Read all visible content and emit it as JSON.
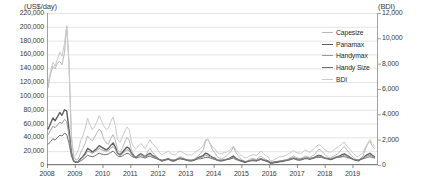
{
  "chart_data": {
    "type": "line",
    "title": "",
    "xlabel": "",
    "ylabel": "(US$/day)",
    "y2label": "(BDI)",
    "grid": true,
    "legend_position": "inside-top-right",
    "ylim": [
      0,
      220000
    ],
    "y2lim": [
      0,
      12000
    ],
    "ytick_labels": [
      "220,000",
      "200,000",
      "180,000",
      "160,000",
      "140,000",
      "120,000",
      "100,000",
      "80,000",
      "60,000",
      "40,000",
      "20,000",
      "0"
    ],
    "ytick_values": [
      220000,
      200000,
      180000,
      160000,
      140000,
      120000,
      100000,
      80000,
      60000,
      40000,
      20000,
      0
    ],
    "y2tick_labels": [
      "12,000",
      "10,000",
      "8,000",
      "6,000",
      "4,000",
      "2,000",
      "0"
    ],
    "y2tick_values": [
      12000,
      10000,
      8000,
      6000,
      4000,
      2000,
      0
    ],
    "xtick_labels": [
      "2008",
      "2009",
      "2010",
      "2011",
      "2012",
      "2013",
      "2014",
      "2015",
      "2016",
      "2017",
      "2018",
      "2019"
    ],
    "xlim": [
      2008.0,
      2019.92
    ],
    "legend": [
      {
        "name": "Capesize",
        "color": "#b9b9b9",
        "width": 1.0,
        "axis": "left"
      },
      {
        "name": "Panamax",
        "color": "#5e5e5e",
        "width": 1.4,
        "axis": "left"
      },
      {
        "name": "Handymax",
        "color": "#9a9a9a",
        "width": 1.0,
        "axis": "left"
      },
      {
        "name": "Handy Size",
        "color": "#6f6f6f",
        "width": 1.0,
        "axis": "left"
      },
      {
        "name": "BDI",
        "color": "#c9c9c9",
        "width": 1.0,
        "axis": "right"
      }
    ],
    "x": [
      2008.04,
      2008.13,
      2008.21,
      2008.29,
      2008.38,
      2008.46,
      2008.54,
      2008.63,
      2008.71,
      2008.79,
      2008.88,
      2008.96,
      2009.04,
      2009.13,
      2009.21,
      2009.29,
      2009.38,
      2009.46,
      2009.54,
      2009.63,
      2009.71,
      2009.79,
      2009.88,
      2009.96,
      2010.04,
      2010.13,
      2010.21,
      2010.29,
      2010.38,
      2010.46,
      2010.54,
      2010.63,
      2010.71,
      2010.79,
      2010.88,
      2010.96,
      2011.04,
      2011.13,
      2011.21,
      2011.29,
      2011.38,
      2011.46,
      2011.54,
      2011.63,
      2011.71,
      2011.79,
      2011.88,
      2011.96,
      2012.04,
      2012.13,
      2012.21,
      2012.29,
      2012.38,
      2012.46,
      2012.54,
      2012.63,
      2012.71,
      2012.79,
      2012.88,
      2012.96,
      2013.04,
      2013.13,
      2013.21,
      2013.29,
      2013.38,
      2013.46,
      2013.54,
      2013.63,
      2013.71,
      2013.79,
      2013.88,
      2013.96,
      2014.04,
      2014.13,
      2014.21,
      2014.29,
      2014.38,
      2014.46,
      2014.54,
      2014.63,
      2014.71,
      2014.79,
      2014.88,
      2014.96,
      2015.04,
      2015.13,
      2015.21,
      2015.29,
      2015.38,
      2015.46,
      2015.54,
      2015.63,
      2015.71,
      2015.79,
      2015.88,
      2015.96,
      2016.04,
      2016.13,
      2016.21,
      2016.29,
      2016.38,
      2016.46,
      2016.54,
      2016.63,
      2016.71,
      2016.79,
      2016.88,
      2016.96,
      2017.04,
      2017.13,
      2017.21,
      2017.29,
      2017.38,
      2017.46,
      2017.54,
      2017.63,
      2017.71,
      2017.79,
      2017.88,
      2017.96,
      2018.04,
      2018.13,
      2018.21,
      2018.29,
      2018.38,
      2018.46,
      2018.54,
      2018.63,
      2018.71,
      2018.79,
      2018.88,
      2018.96,
      2019.04,
      2019.13,
      2019.21,
      2019.29,
      2019.38,
      2019.46,
      2019.54,
      2019.63,
      2019.71,
      2019.79
    ],
    "series": [
      {
        "name": "Capesize",
        "axis": "left",
        "values": [
          112000,
          132000,
          143000,
          139000,
          148000,
          150000,
          145000,
          163000,
          201000,
          150000,
          40000,
          12000,
          7000,
          9000,
          18000,
          24000,
          32000,
          42000,
          38000,
          35000,
          40000,
          46000,
          52000,
          48000,
          38000,
          32000,
          30000,
          38000,
          44000,
          36000,
          22000,
          18000,
          24000,
          32000,
          40000,
          36000,
          22000,
          14000,
          10000,
          13000,
          16000,
          14000,
          12000,
          20000,
          24000,
          19000,
          15000,
          12000,
          8000,
          5000,
          6000,
          7000,
          8000,
          6000,
          5000,
          6000,
          9000,
          12000,
          11000,
          9000,
          8000,
          7000,
          6000,
          8000,
          11000,
          14000,
          17000,
          22000,
          34000,
          38000,
          30000,
          22000,
          18000,
          12000,
          10000,
          9000,
          11000,
          13000,
          16000,
          20000,
          26000,
          19000,
          14000,
          10000,
          7000,
          5000,
          6000,
          8000,
          10000,
          9000,
          8000,
          11000,
          13000,
          10000,
          8000,
          6000,
          3000,
          3000,
          4000,
          5000,
          6000,
          6000,
          7000,
          8000,
          9000,
          11000,
          13000,
          11000,
          10000,
          9000,
          11000,
          13000,
          12000,
          11000,
          13000,
          15000,
          19000,
          23000,
          21000,
          17000,
          14000,
          11000,
          10000,
          12000,
          14000,
          16000,
          19000,
          24000,
          27000,
          22000,
          18000,
          14000,
          11000,
          8000,
          7000,
          9000,
          13000,
          22000,
          30000,
          34000,
          28000,
          24000
        ]
      },
      {
        "name": "Panamax",
        "axis": "left",
        "values": [
          52000,
          60000,
          68000,
          64000,
          70000,
          76000,
          72000,
          80000,
          78000,
          52000,
          18000,
          6000,
          4000,
          5000,
          9000,
          12000,
          17000,
          24000,
          22000,
          19000,
          21000,
          24000,
          28000,
          26000,
          24000,
          22000,
          24000,
          28000,
          32000,
          26000,
          17000,
          15000,
          18000,
          22000,
          26000,
          24000,
          17000,
          13000,
          11000,
          14000,
          16000,
          14000,
          12000,
          15000,
          17000,
          14000,
          12000,
          10000,
          8000,
          6000,
          7000,
          8000,
          9000,
          7000,
          6000,
          7000,
          9000,
          10000,
          9000,
          8000,
          7000,
          6000,
          6000,
          7000,
          9000,
          11000,
          12000,
          14000,
          17000,
          16000,
          13000,
          11000,
          10000,
          7000,
          6000,
          6000,
          7000,
          8000,
          9000,
          11000,
          13000,
          10000,
          8000,
          6000,
          5000,
          4000,
          5000,
          6000,
          7000,
          7000,
          6000,
          8000,
          9000,
          7000,
          6000,
          5000,
          3000,
          3000,
          3500,
          4000,
          5000,
          5000,
          6000,
          7000,
          8000,
          9000,
          10000,
          9000,
          8000,
          8000,
          9000,
          10000,
          10000,
          9000,
          10000,
          11000,
          13000,
          14000,
          13000,
          11000,
          10000,
          9000,
          8000,
          9000,
          11000,
          12000,
          13000,
          15000,
          16000,
          14000,
          12000,
          10000,
          8000,
          7000,
          6000,
          8000,
          10000,
          13000,
          15000,
          17000,
          14000,
          12000
        ]
      },
      {
        "name": "Handymax",
        "axis": "left",
        "values": [
          44000,
          50000,
          56000,
          54000,
          58000,
          62000,
          60000,
          66000,
          63000,
          43000,
          16000,
          6000,
          4000,
          5000,
          8000,
          11000,
          15000,
          20000,
          19000,
          17000,
          19000,
          21000,
          24000,
          22000,
          21000,
          20000,
          21000,
          24000,
          27000,
          23000,
          16000,
          14000,
          16000,
          19000,
          22000,
          21000,
          16000,
          12000,
          11000,
          13000,
          15000,
          13000,
          12000,
          14000,
          16000,
          13000,
          11000,
          10000,
          8000,
          7000,
          7000,
          8000,
          9000,
          8000,
          7000,
          8000,
          9000,
          10000,
          9000,
          8000,
          7000,
          7000,
          7000,
          8000,
          9000,
          10000,
          11000,
          12000,
          14000,
          13000,
          12000,
          10000,
          9000,
          7000,
          7000,
          7000,
          8000,
          8000,
          9000,
          10000,
          11000,
          9000,
          8000,
          7000,
          6000,
          5000,
          5000,
          6000,
          7000,
          7000,
          7000,
          8000,
          9000,
          8000,
          7000,
          6000,
          4000,
          4000,
          4500,
          5000,
          6000,
          6000,
          7000,
          7000,
          8000,
          9000,
          10000,
          9000,
          8000,
          8000,
          9000,
          10000,
          10000,
          9000,
          10000,
          11000,
          12000,
          13000,
          12000,
          11000,
          10000,
          9000,
          9000,
          10000,
          11000,
          12000,
          12000,
          13000,
          14000,
          13000,
          11000,
          10000,
          8000,
          8000,
          7000,
          8000,
          10000,
          12000,
          13000,
          14000,
          13000,
          11000
        ]
      },
      {
        "name": "Handy Size",
        "axis": "left",
        "values": [
          30000,
          34000,
          38000,
          36000,
          40000,
          43000,
          42000,
          46000,
          44000,
          32000,
          13000,
          5000,
          4000,
          4000,
          6000,
          8000,
          11000,
          14000,
          13000,
          12000,
          13000,
          15000,
          17000,
          16000,
          15000,
          15000,
          16000,
          18000,
          20000,
          17000,
          13000,
          12000,
          13000,
          15000,
          17000,
          16000,
          13000,
          11000,
          10000,
          11000,
          12000,
          11000,
          10000,
          12000,
          13000,
          11000,
          10000,
          9000,
          8000,
          7000,
          7000,
          8000,
          8000,
          7000,
          7000,
          7000,
          8000,
          9000,
          8000,
          8000,
          7000,
          7000,
          7000,
          7000,
          8000,
          9000,
          9000,
          10000,
          11000,
          11000,
          10000,
          9000,
          8000,
          7000,
          7000,
          7000,
          7000,
          8000,
          8000,
          9000,
          10000,
          8000,
          7000,
          7000,
          6000,
          5000,
          5000,
          6000,
          6000,
          6000,
          6000,
          7000,
          8000,
          7000,
          6000,
          6000,
          4000,
          4000,
          4500,
          5000,
          5000,
          5500,
          6000,
          6500,
          7000,
          8000,
          9000,
          8000,
          7000,
          7000,
          8000,
          9000,
          9000,
          8000,
          9000,
          10000,
          11000,
          11000,
          11000,
          10000,
          9000,
          9000,
          8000,
          9000,
          10000,
          11000,
          11000,
          12000,
          12000,
          11000,
          10000,
          9000,
          8000,
          7000,
          7000,
          8000,
          9000,
          10000,
          11000,
          12000,
          11000,
          10000
        ]
      },
      {
        "name": "BDI",
        "axis": "right",
        "values": [
          6500,
          7400,
          8100,
          7800,
          8400,
          8900,
          8600,
          9600,
          11000,
          8000,
          2200,
          700,
          800,
          1200,
          1900,
          2300,
          2900,
          3700,
          3200,
          2800,
          3000,
          3400,
          3900,
          3500,
          3100,
          2800,
          2900,
          3400,
          3800,
          3100,
          2000,
          1800,
          2200,
          2600,
          3000,
          2800,
          1800,
          1400,
          1300,
          1500,
          1700,
          1500,
          1300,
          1700,
          2000,
          1700,
          1500,
          1300,
          1000,
          800,
          900,
          1000,
          1100,
          900,
          800,
          800,
          1000,
          1100,
          1000,
          900,
          800,
          800,
          800,
          900,
          1100,
          1200,
          1300,
          1600,
          2000,
          2000,
          1700,
          1400,
          1300,
          1000,
          900,
          900,
          1000,
          1000,
          1100,
          1300,
          1500,
          1200,
          1000,
          800,
          700,
          550,
          600,
          700,
          800,
          800,
          750,
          950,
          1100,
          900,
          750,
          650,
          350,
          350,
          450,
          550,
          650,
          650,
          700,
          800,
          900,
          1000,
          1150,
          1000,
          950,
          900,
          1000,
          1200,
          1100,
          1000,
          1150,
          1300,
          1500,
          1600,
          1500,
          1300,
          1150,
          1050,
          1000,
          1100,
          1300,
          1400,
          1500,
          1700,
          1800,
          1500,
          1300,
          1100,
          900,
          700,
          650,
          800,
          1000,
          1400,
          1700,
          2000,
          1700,
          1500
        ]
      }
    ]
  }
}
